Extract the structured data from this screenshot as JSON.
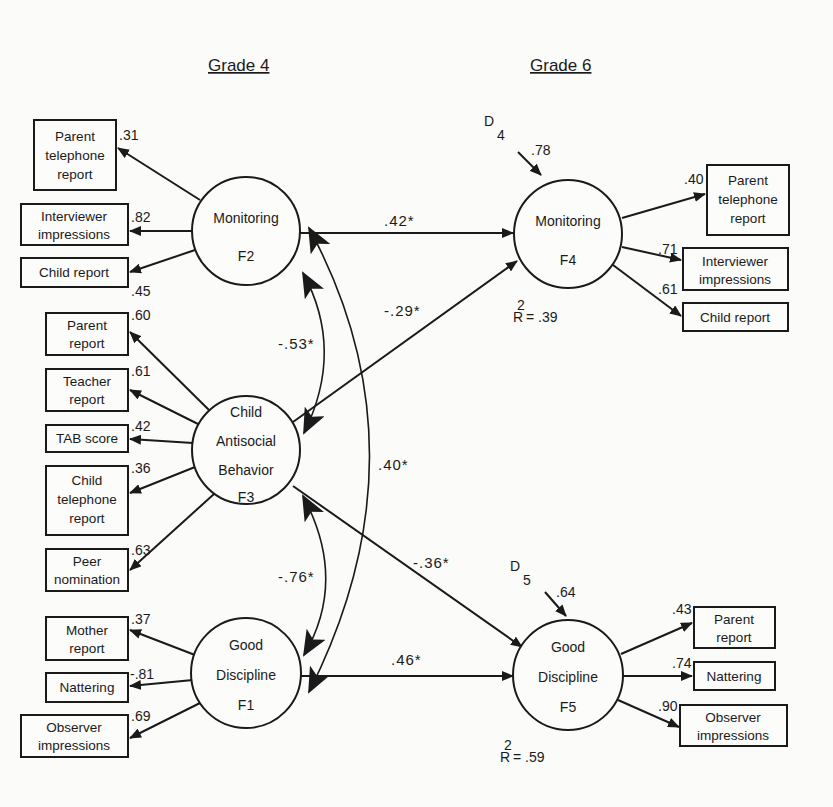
{
  "headers": {
    "left": "Grade 4",
    "right": "Grade 6"
  },
  "latents": {
    "F2": {
      "lines": [
        "Monitoring",
        "F2"
      ]
    },
    "F3": {
      "lines": [
        "Child",
        "Antisocial",
        "Behavior",
        "F3"
      ]
    },
    "F1": {
      "lines": [
        "Good",
        "Discipline",
        "F1"
      ]
    },
    "F4": {
      "lines": [
        "Monitoring",
        "F4"
      ],
      "r2_label": "R",
      "r2_sup": "2",
      "r2_value": "= .39",
      "disturbance": "D",
      "disturbance_sub": "4",
      "disturbance_value": ".78"
    },
    "F5": {
      "lines": [
        "Good",
        "Discipline",
        "F5"
      ],
      "r2_label": "R",
      "r2_sup": "2",
      "r2_value": "= .59",
      "disturbance": "D",
      "disturbance_sub": "5",
      "disturbance_value": ".64"
    }
  },
  "indicators": {
    "f2": [
      {
        "lines": [
          "Parent",
          "telephone",
          "report"
        ],
        "loading": ".31"
      },
      {
        "lines": [
          "Interviewer",
          "impressions"
        ],
        "loading": ".82"
      },
      {
        "lines": [
          "Child report"
        ],
        "loading": ".45"
      }
    ],
    "f3": [
      {
        "lines": [
          "Parent",
          "report"
        ],
        "loading": ".60"
      },
      {
        "lines": [
          "Teacher",
          "report"
        ],
        "loading": ".61"
      },
      {
        "lines": [
          "TAB score"
        ],
        "loading": ".42"
      },
      {
        "lines": [
          "Child",
          "telephone",
          "report"
        ],
        "loading": ".36"
      },
      {
        "lines": [
          "Peer",
          "nomination"
        ],
        "loading": ".63"
      }
    ],
    "f1": [
      {
        "lines": [
          "Mother",
          "report"
        ],
        "loading": ".37"
      },
      {
        "lines": [
          "Nattering"
        ],
        "loading": "-.81"
      },
      {
        "lines": [
          "Observer",
          "impressions"
        ],
        "loading": ".69"
      }
    ],
    "f4": [
      {
        "lines": [
          "Parent",
          "telephone",
          "report"
        ],
        "loading": ".40"
      },
      {
        "lines": [
          "Interviewer",
          "impressions"
        ],
        "loading": ".71"
      },
      {
        "lines": [
          "Child report"
        ],
        "loading": ".61"
      }
    ],
    "f5": [
      {
        "lines": [
          "Parent",
          "report"
        ],
        "loading": ".43"
      },
      {
        "lines": [
          "Nattering"
        ],
        "loading": ".74"
      },
      {
        "lines": [
          "Observer",
          "impressions"
        ],
        "loading": ".90"
      }
    ]
  },
  "paths": {
    "f2_f4": ".42*",
    "f3_f4": "-.29*",
    "f3_f5": "-.36*",
    "f1_f5": ".46*"
  },
  "correlations": {
    "f2_f3": "-.53*",
    "f3_f1": "-.76*",
    "f2_f1": ".40*"
  }
}
